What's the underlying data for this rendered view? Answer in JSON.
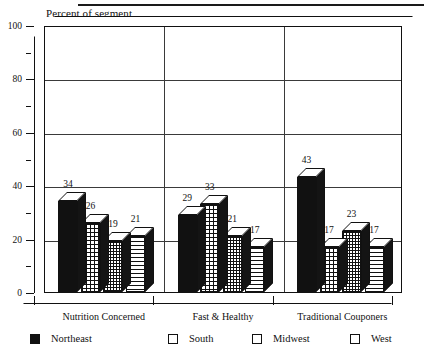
{
  "chart_data": {
    "type": "bar",
    "title": "",
    "ylabel": "Percent of segment",
    "xlabel": "",
    "ylim": [
      0,
      100
    ],
    "ytick_labels": [
      "0",
      "20",
      "40",
      "60",
      "80",
      "100"
    ],
    "ytick_values": [
      0,
      20,
      40,
      60,
      80,
      100
    ],
    "minor_tick_values": [
      10,
      30,
      50,
      70,
      90
    ],
    "gridlines": [
      20,
      40,
      60,
      80,
      100
    ],
    "grid": true,
    "legend_position": "bottom",
    "style": "3d-columns",
    "categories": [
      "Nutrition Concerned",
      "Fast & Healthy",
      "Traditional Couponers"
    ],
    "series": [
      {
        "name": "Northeast",
        "pattern": "solid",
        "values": [
          34,
          29,
          43
        ]
      },
      {
        "name": "South",
        "pattern": "grid",
        "values": [
          26,
          33,
          17
        ]
      },
      {
        "name": "Midwest",
        "pattern": "dots",
        "values": [
          19,
          21,
          23
        ]
      },
      {
        "name": "West",
        "pattern": "hlines",
        "values": [
          21,
          17,
          17
        ]
      }
    ]
  },
  "legend": {
    "items": [
      {
        "label": "Northeast",
        "pattern": "solid"
      },
      {
        "label": "South",
        "pattern": "grid"
      },
      {
        "label": "Midwest",
        "pattern": "dots"
      },
      {
        "label": "West",
        "pattern": "hlines"
      }
    ]
  },
  "colors": {
    "ink": "#111111",
    "grid": "#3a3a3a",
    "background": "#ffffff"
  }
}
